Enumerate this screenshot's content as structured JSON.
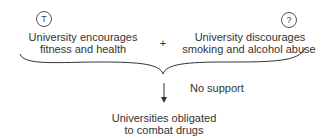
{
  "diagram": {
    "premise_left": {
      "badge": "T",
      "line1": "University encourages",
      "line2": "fitness and health"
    },
    "operator": "+",
    "premise_right": {
      "badge": "?",
      "line1": "University discourages",
      "line2": "smoking and alcohol abuse"
    },
    "link_label": "No support",
    "conclusion": {
      "line1": "Universities obligated",
      "line2": "to combat drugs"
    }
  }
}
